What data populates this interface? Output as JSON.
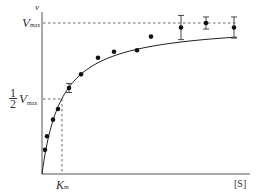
{
  "chart_data": {
    "type": "scatter",
    "title": "",
    "xlabel": "[S]",
    "ylabel": "v",
    "reference_lines": [
      {
        "label": "V_max",
        "orientation": "horizontal",
        "value": 1.0,
        "style": "dashed"
      },
      {
        "label": "1/2 V_max",
        "orientation": "horizontal",
        "value": 0.5,
        "style": "dashed"
      },
      {
        "label": "K_m",
        "orientation": "vertical",
        "value": 1.0,
        "style": "dashed"
      }
    ],
    "axis_ticks": {
      "y": [
        "V_max",
        "1/2 V_max"
      ],
      "x": [
        "K_m"
      ]
    },
    "fit_curve": {
      "model": "v = Vmax*S/(Km+S)",
      "Vmax": 1.0,
      "Km": 1.0
    },
    "series": [
      {
        "name": "measured",
        "points": [
          {
            "x": 0.15,
            "y": 0.16
          },
          {
            "x": 0.25,
            "y": 0.25
          },
          {
            "x": 0.55,
            "y": 0.36
          },
          {
            "x": 0.8,
            "y": 0.43
          },
          {
            "x": 1.35,
            "y": 0.57,
            "err": 0.03
          },
          {
            "x": 1.95,
            "y": 0.66
          },
          {
            "x": 2.8,
            "y": 0.77
          },
          {
            "x": 3.6,
            "y": 0.81
          },
          {
            "x": 4.75,
            "y": 0.82
          },
          {
            "x": 5.45,
            "y": 0.91
          },
          {
            "x": 6.95,
            "y": 0.97,
            "err": 0.08
          },
          {
            "x": 8.2,
            "y": 1.0,
            "err": 0.04
          },
          {
            "x": 9.6,
            "y": 0.97,
            "err": 0.07
          }
        ]
      }
    ],
    "xlim": [
      0,
      10.4
    ],
    "ylim": [
      0,
      1.07
    ],
    "grid": false,
    "legend": "none"
  },
  "labels": {
    "y_axis": "v",
    "vmax_main": "V",
    "vmax_sub": "max",
    "half_num": "1",
    "half_den": "2",
    "half_v": "V",
    "half_sub": "max",
    "km_main": "K",
    "km_sub": "m",
    "x_axis": "[S]"
  }
}
